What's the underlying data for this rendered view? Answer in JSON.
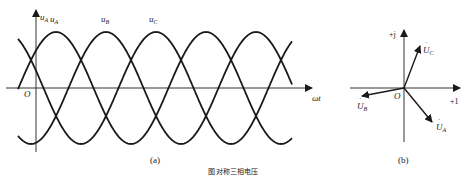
{
  "waveform": {
    "panel_label": "(a)",
    "origin_label": "O",
    "x_axis_label": "ωt",
    "curves": [
      {
        "name": "u",
        "sub": "A",
        "phase_deg": 0
      },
      {
        "name": "u",
        "sub": "B",
        "phase_deg": -120
      },
      {
        "name": "u",
        "sub": "C",
        "phase_deg": 120
      }
    ]
  },
  "phasor": {
    "panel_label": "(b)",
    "origin_label": "O",
    "real_axis_label": "+1",
    "imag_axis_label": "+j",
    "phasors": [
      {
        "name": "U",
        "sub": "A",
        "angle_deg": -30
      },
      {
        "name": "U",
        "sub": "B",
        "angle_deg": 190
      },
      {
        "name": "U",
        "sub": "C",
        "angle_deg": 70
      }
    ]
  },
  "caption": "图  对称三相电压",
  "colors": {
    "stroke": "#1a1a1a",
    "axis": "#333333"
  }
}
